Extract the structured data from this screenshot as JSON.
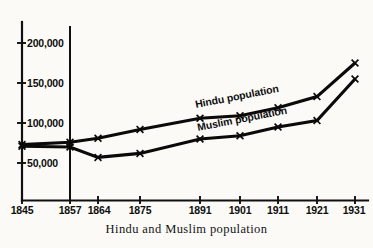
{
  "caption": "Hindu and Muslim population",
  "chart_data": {
    "type": "line",
    "title": "",
    "subtitle": "",
    "caption": "Hindu and Muslim population",
    "xlabel": "",
    "ylabel": "",
    "categories": [
      "1845",
      "1857",
      "1864",
      "1875",
      "1891",
      "1901",
      "1911",
      "1921",
      "1931"
    ],
    "x": [
      1845,
      1857,
      1864,
      1875,
      1891,
      1901,
      1911,
      1921,
      1931
    ],
    "xtick_labels": [
      "1845",
      "1857",
      "1864",
      "1875",
      "1891",
      "1901",
      "1911",
      "1921",
      "1931"
    ],
    "ytick_labels": [
      "50,000",
      "100,000",
      "150,000",
      "200,000"
    ],
    "ytick_values": [
      50000,
      100000,
      150000,
      200000
    ],
    "ylim": [
      0,
      225000
    ],
    "xlim": [
      1845,
      1931
    ],
    "grid": false,
    "legend_position": "inline-on-lines",
    "marker": "x",
    "annotations": [
      {
        "text": "Hindu population",
        "series": "Hindu population",
        "rotation": -11
      },
      {
        "text": "Muslim population",
        "series": "Muslim population",
        "rotation": -11
      }
    ],
    "vertical_rule_at": 1857,
    "series": [
      {
        "name": "Hindu population",
        "label": "Hindu population",
        "values": [
          73000,
          76000,
          81000,
          92000,
          106000,
          109000,
          119000,
          133000,
          175000
        ]
      },
      {
        "name": "Muslim population",
        "label": "Muslim population",
        "values": [
          71000,
          70000,
          57000,
          62000,
          80000,
          84000,
          95000,
          103000,
          155000
        ]
      }
    ]
  },
  "colors": {
    "background": "#fbfaf7",
    "ink": "#0d0d0d",
    "line": "#0a0a0a"
  }
}
